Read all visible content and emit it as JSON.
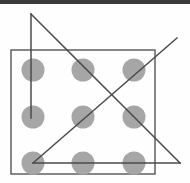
{
  "figure": {
    "title": "Nine-dot puzzle with four connected line segments",
    "canvas": {
      "width": 190,
      "height": 183,
      "background": "#fefefe"
    },
    "top_bar": {
      "color": "#3a3a3a",
      "height": 4
    },
    "frame": {
      "label": "bounding-rectangle",
      "x": 11,
      "y": 50,
      "width": 144,
      "height": 124,
      "stroke": "#555555",
      "stroke_width": 1.4,
      "fill": "none"
    },
    "dot_style": {
      "fill": "#a6a6a6",
      "radius": 11.5
    },
    "dots": [
      {
        "name": "dot-r1c1",
        "row": 1,
        "col": 1,
        "cx": 33,
        "cy": 70
      },
      {
        "name": "dot-r1c2",
        "row": 1,
        "col": 2,
        "cx": 83,
        "cy": 70
      },
      {
        "name": "dot-r1c3",
        "row": 1,
        "col": 3,
        "cx": 134,
        "cy": 70
      },
      {
        "name": "dot-r2c1",
        "row": 2,
        "col": 1,
        "cx": 33,
        "cy": 117
      },
      {
        "name": "dot-r2c2",
        "row": 2,
        "col": 2,
        "cx": 83,
        "cy": 117
      },
      {
        "name": "dot-r2c3",
        "row": 2,
        "col": 3,
        "cx": 134,
        "cy": 117
      },
      {
        "name": "dot-r3c1",
        "row": 3,
        "col": 1,
        "cx": 33,
        "cy": 163
      },
      {
        "name": "dot-r3c2",
        "row": 3,
        "col": 2,
        "cx": 83,
        "cy": 163
      },
      {
        "name": "dot-r3c3",
        "row": 3,
        "col": 3,
        "cx": 134,
        "cy": 163
      }
    ],
    "line_style": {
      "stroke": "#4a4a4a",
      "stroke_width": 1.5
    },
    "lines": [
      {
        "name": "vertical-line",
        "description": "vertical segment from apex above grid down to middle-left dot",
        "x1": 31,
        "y1": 14,
        "x2": 31,
        "y2": 118
      },
      {
        "name": "descending-diagonal",
        "description": "diagonal from top apex down to lower-right outside corner",
        "x1": 31,
        "y1": 14,
        "x2": 180,
        "y2": 163
      },
      {
        "name": "ascending-diagonal",
        "description": "diagonal from bottom-left dot up past the top-right corner",
        "x1": 33,
        "y1": 163,
        "x2": 177,
        "y2": 38
      },
      {
        "name": "horizontal-base-line",
        "description": "horizontal segment through bottom row of dots to right vertex",
        "x1": 33,
        "y1": 163,
        "x2": 180,
        "y2": 163
      }
    ]
  }
}
